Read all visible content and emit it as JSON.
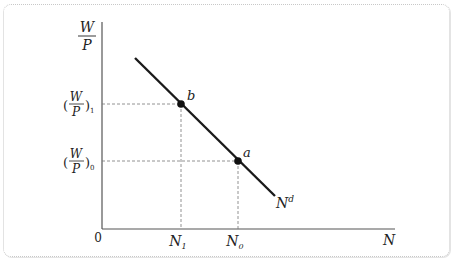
{
  "diagram": {
    "type": "labor-demand-curve",
    "y_axis": {
      "label_num": "W",
      "label_den": "P"
    },
    "x_axis": {
      "label": "N",
      "origin": "0"
    },
    "curve": {
      "label": "N",
      "superscript": "d"
    },
    "points": [
      {
        "name": "b",
        "x_label": "N",
        "x_sub": "1",
        "y_num": "W",
        "y_den": "P",
        "y_sub": "1"
      },
      {
        "name": "a",
        "x_label": "N",
        "x_sub": "0",
        "y_num": "W",
        "y_den": "P",
        "y_sub": "0"
      }
    ],
    "colors": {
      "curve": "#1a1a1a",
      "axis": "#555555",
      "guide": "#777777",
      "frame": "#c8c8c8"
    }
  }
}
